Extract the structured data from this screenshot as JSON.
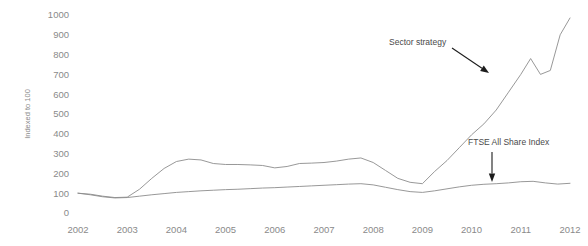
{
  "chart_data": {
    "type": "line",
    "title": "",
    "xlabel": "",
    "ylabel": "Indexed to 100",
    "xlim": [
      2002,
      2012
    ],
    "ylim": [
      0,
      1000
    ],
    "grid": false,
    "legend_position": "none",
    "background_color": "#ffffff",
    "x_tick_labels": [
      "2002",
      "2003",
      "2004",
      "2005",
      "2006",
      "2007",
      "2008",
      "2009",
      "2010",
      "2011",
      "2012"
    ],
    "y_tick_labels": [
      "0",
      "100",
      "200",
      "300",
      "400",
      "500",
      "600",
      "700",
      "800",
      "900",
      "1000"
    ],
    "y_tick_values": [
      0,
      100,
      200,
      300,
      400,
      500,
      600,
      700,
      800,
      900,
      1000
    ],
    "series": [
      {
        "name": "Sector strategy",
        "color": "#8c8c8c",
        "line_width": 0.9,
        "x": [
          2002.0,
          2002.25,
          2002.5,
          2002.75,
          2003.0,
          2003.25,
          2003.5,
          2003.75,
          2004.0,
          2004.25,
          2004.5,
          2004.75,
          2005.0,
          2005.25,
          2005.5,
          2005.75,
          2006.0,
          2006.25,
          2006.5,
          2006.75,
          2007.0,
          2007.25,
          2007.5,
          2007.75,
          2008.0,
          2008.25,
          2008.5,
          2008.75,
          2009.0,
          2009.25,
          2009.5,
          2009.75,
          2010.0,
          2010.25,
          2010.5,
          2010.75,
          2011.0,
          2011.2,
          2011.4,
          2011.6,
          2011.8,
          2012.0
        ],
        "y": [
          100,
          95,
          85,
          78,
          80,
          120,
          175,
          225,
          260,
          272,
          268,
          250,
          245,
          245,
          243,
          240,
          228,
          235,
          250,
          252,
          255,
          262,
          272,
          278,
          255,
          215,
          175,
          155,
          148,
          210,
          265,
          330,
          395,
          450,
          520,
          610,
          700,
          780,
          700,
          720,
          900,
          985
        ]
      },
      {
        "name": "FTSE All Share Index",
        "color": "#8c8c8c",
        "line_width": 0.9,
        "x": [
          2002.0,
          2002.25,
          2002.5,
          2002.75,
          2003.0,
          2003.25,
          2003.5,
          2003.75,
          2004.0,
          2004.25,
          2004.5,
          2004.75,
          2005.0,
          2005.25,
          2005.5,
          2005.75,
          2006.0,
          2006.25,
          2006.5,
          2006.75,
          2007.0,
          2007.25,
          2007.5,
          2007.75,
          2008.0,
          2008.25,
          2008.5,
          2008.75,
          2009.0,
          2009.25,
          2009.5,
          2009.75,
          2010.0,
          2010.25,
          2010.5,
          2010.75,
          2011.0,
          2011.25,
          2011.5,
          2011.75,
          2012.0
        ],
        "y": [
          100,
          92,
          82,
          76,
          78,
          85,
          92,
          98,
          104,
          108,
          112,
          115,
          118,
          120,
          123,
          126,
          128,
          131,
          134,
          137,
          140,
          143,
          146,
          148,
          142,
          130,
          118,
          108,
          104,
          112,
          122,
          132,
          140,
          145,
          148,
          152,
          158,
          160,
          152,
          146,
          150
        ]
      }
    ],
    "annotations": [
      {
        "id": "sector-strategy",
        "text": "Sector strategy",
        "text_x": 389,
        "text_y": 45,
        "arrow_from_x": 452,
        "arrow_from_y": 48,
        "arrow_to_x": 489,
        "arrow_to_y": 73
      },
      {
        "id": "ftse-all-share-index",
        "text": "FTSE All Share Index",
        "text_x": 468,
        "text_y": 145,
        "arrow_from_x": 492,
        "arrow_from_y": 152,
        "arrow_to_x": 492,
        "arrow_to_y": 182
      }
    ]
  }
}
